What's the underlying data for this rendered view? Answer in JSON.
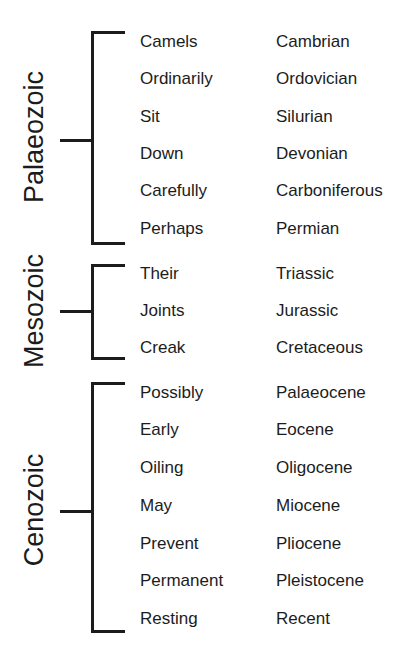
{
  "diagram": {
    "type": "bracket-mnemonic-table",
    "eras": [
      {
        "name": "Palaeozoic",
        "rows": [
          {
            "mnemonic": "Camels",
            "period": "Cambrian"
          },
          {
            "mnemonic": "Ordinarily",
            "period": "Ordovician"
          },
          {
            "mnemonic": "Sit",
            "period": "Silurian"
          },
          {
            "mnemonic": "Down",
            "period": "Devonian"
          },
          {
            "mnemonic": "Carefully",
            "period": "Carboniferous"
          },
          {
            "mnemonic": "Perhaps",
            "period": "Permian"
          }
        ]
      },
      {
        "name": "Mesozoic",
        "rows": [
          {
            "mnemonic": "Their",
            "period": "Triassic"
          },
          {
            "mnemonic": "Joints",
            "period": "Jurassic"
          },
          {
            "mnemonic": "Creak",
            "period": "Cretaceous"
          }
        ]
      },
      {
        "name": "Cenozoic",
        "rows": [
          {
            "mnemonic": "Possibly",
            "period": "Palaeocene"
          },
          {
            "mnemonic": "Early",
            "period": "Eocene"
          },
          {
            "mnemonic": "Oiling",
            "period": "Oligocene"
          },
          {
            "mnemonic": "May",
            "period": "Miocene"
          },
          {
            "mnemonic": "Prevent",
            "period": "Pliocene"
          },
          {
            "mnemonic": "Permanent",
            "period": "Pleistocene"
          },
          {
            "mnemonic": "Resting",
            "period": "Recent"
          }
        ]
      }
    ]
  }
}
